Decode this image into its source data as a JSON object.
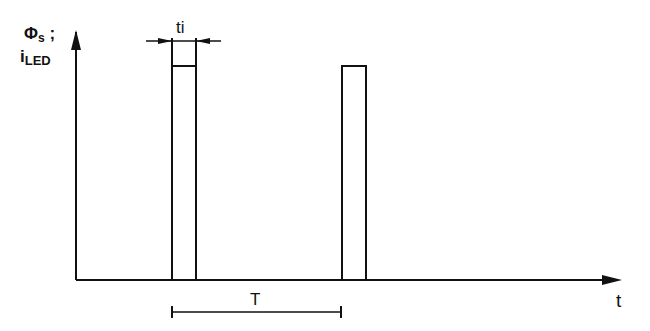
{
  "diagram": {
    "title": "",
    "y_axis_label": {
      "line1_symbol": "Φ",
      "line1_subscript": "s",
      "line1_suffix": ";",
      "line2_symbol": "i",
      "line2_subscript": "LED"
    },
    "x_axis_label": "t",
    "pulse_width_label": "ti",
    "period_label": "T",
    "pulses": [
      {
        "x_start": 172,
        "x_end": 196,
        "top": 66
      },
      {
        "x_start": 342,
        "x_end": 366,
        "top": 66
      }
    ],
    "colors": {
      "line": "#111111",
      "background": "#ffffff"
    }
  }
}
